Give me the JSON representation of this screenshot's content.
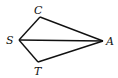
{
  "diagram": {
    "type": "geometry-quadrilateral",
    "points": {
      "S": {
        "x": 19,
        "y": 40
      },
      "C": {
        "x": 40,
        "y": 17
      },
      "A": {
        "x": 103,
        "y": 41
      },
      "T": {
        "x": 38,
        "y": 62
      }
    },
    "segments": [
      [
        "S",
        "C"
      ],
      [
        "C",
        "A"
      ],
      [
        "A",
        "T"
      ],
      [
        "T",
        "S"
      ],
      [
        "S",
        "A"
      ]
    ],
    "labels": {
      "C": {
        "text": "C",
        "x": 34,
        "y": 14
      },
      "S": {
        "text": "S",
        "x": 6,
        "y": 44
      },
      "A": {
        "text": "A",
        "x": 106,
        "y": 45
      },
      "T": {
        "text": "T",
        "x": 34,
        "y": 75
      }
    },
    "stroke_color": "#111111"
  }
}
